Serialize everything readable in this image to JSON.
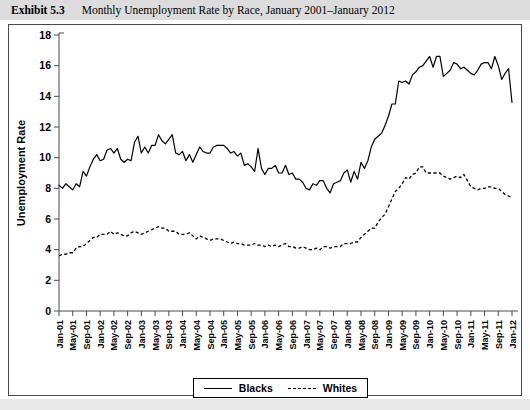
{
  "caption": {
    "number": "Exhibit 5.3",
    "title": "Monthly Unemployment Rate by Race, January 2001–January 2012"
  },
  "legend": {
    "items": [
      {
        "label": "Blacks",
        "style": "solid"
      },
      {
        "label": "Whites",
        "style": "dashed"
      }
    ]
  },
  "chart_data": {
    "type": "line",
    "title": "Monthly Unemployment Rate by Race, January 2001–January 2012",
    "xlabel": "",
    "ylabel": "Unemployment Rate",
    "ylim": [
      0,
      18
    ],
    "yticks": [
      0,
      2,
      4,
      6,
      8,
      10,
      12,
      14,
      16,
      18
    ],
    "grid": false,
    "legend_position": "bottom",
    "x_tick_labels": [
      "Jan-01",
      "May-01",
      "Sep-01",
      "Jan-02",
      "May-02",
      "Sep-02",
      "Jan-03",
      "May-03",
      "Sep-03",
      "Jan-04",
      "May-04",
      "Sep-04",
      "Jan-05",
      "May-05",
      "Sep-05",
      "Jan-06",
      "May-06",
      "Sep-06",
      "Jan-07",
      "May-07",
      "Sep-07",
      "Jan-08",
      "May-08",
      "Sep-08",
      "Jan-09",
      "May-09",
      "Sep-09",
      "Jan-10",
      "May-10",
      "Sep-10",
      "Jan-11",
      "May-11",
      "Sep-11",
      "Jan-12"
    ],
    "x_tick_every_n_points": 4,
    "x": [
      "Jan-01",
      "Feb-01",
      "Mar-01",
      "Apr-01",
      "May-01",
      "Jun-01",
      "Jul-01",
      "Aug-01",
      "Sep-01",
      "Oct-01",
      "Nov-01",
      "Dec-01",
      "Jan-02",
      "Feb-02",
      "Mar-02",
      "Apr-02",
      "May-02",
      "Jun-02",
      "Jul-02",
      "Aug-02",
      "Sep-02",
      "Oct-02",
      "Nov-02",
      "Dec-02",
      "Jan-03",
      "Feb-03",
      "Mar-03",
      "Apr-03",
      "May-03",
      "Jun-03",
      "Jul-03",
      "Aug-03",
      "Sep-03",
      "Oct-03",
      "Nov-03",
      "Dec-03",
      "Jan-04",
      "Feb-04",
      "Mar-04",
      "Apr-04",
      "May-04",
      "Jun-04",
      "Jul-04",
      "Aug-04",
      "Sep-04",
      "Oct-04",
      "Nov-04",
      "Dec-04",
      "Jan-05",
      "Feb-05",
      "Mar-05",
      "Apr-05",
      "May-05",
      "Jun-05",
      "Jul-05",
      "Aug-05",
      "Sep-05",
      "Oct-05",
      "Nov-05",
      "Dec-05",
      "Jan-06",
      "Feb-06",
      "Mar-06",
      "Apr-06",
      "May-06",
      "Jun-06",
      "Jul-06",
      "Aug-06",
      "Sep-06",
      "Oct-06",
      "Nov-06",
      "Dec-06",
      "Jan-07",
      "Feb-07",
      "Mar-07",
      "Apr-07",
      "May-07",
      "Jun-07",
      "Jul-07",
      "Aug-07",
      "Sep-07",
      "Oct-07",
      "Nov-07",
      "Dec-07",
      "Jan-08",
      "Feb-08",
      "Mar-08",
      "Apr-08",
      "May-08",
      "Jun-08",
      "Jul-08",
      "Aug-08",
      "Sep-08",
      "Oct-08",
      "Nov-08",
      "Dec-08",
      "Jan-09",
      "Feb-09",
      "Mar-09",
      "Apr-09",
      "May-09",
      "Jun-09",
      "Jul-09",
      "Aug-09",
      "Sep-09",
      "Oct-09",
      "Nov-09",
      "Dec-09",
      "Jan-10",
      "Feb-10",
      "Mar-10",
      "Apr-10",
      "May-10",
      "Jun-10",
      "Jul-10",
      "Aug-10",
      "Sep-10",
      "Oct-10",
      "Nov-10",
      "Dec-10",
      "Jan-11",
      "Feb-11",
      "Mar-11",
      "Apr-11",
      "May-11",
      "Jun-11",
      "Jul-11",
      "Aug-11",
      "Sep-11",
      "Oct-11",
      "Nov-11",
      "Dec-11",
      "Jan-12"
    ],
    "series": [
      {
        "name": "Blacks",
        "style": "solid",
        "values": [
          8.2,
          8.0,
          8.3,
          8.1,
          7.9,
          8.3,
          8.1,
          9.1,
          8.8,
          9.4,
          9.9,
          10.2,
          9.8,
          9.9,
          10.5,
          10.6,
          10.3,
          10.6,
          9.9,
          9.7,
          9.9,
          9.8,
          11.0,
          11.4,
          10.3,
          10.7,
          10.3,
          10.8,
          10.8,
          11.5,
          11.1,
          10.9,
          11.2,
          11.5,
          10.3,
          10.2,
          10.4,
          9.8,
          10.2,
          9.7,
          10.2,
          10.7,
          10.4,
          10.3,
          10.3,
          10.7,
          10.8,
          10.8,
          10.8,
          10.6,
          10.3,
          10.4,
          10.1,
          10.3,
          9.5,
          9.6,
          9.4,
          9.1,
          10.6,
          9.3,
          8.9,
          9.3,
          9.3,
          9.5,
          9.0,
          9.0,
          9.5,
          8.9,
          9.0,
          8.6,
          8.6,
          8.4,
          8.0,
          7.9,
          8.3,
          8.2,
          8.5,
          8.5,
          8.0,
          7.7,
          8.3,
          8.4,
          8.5,
          9.0,
          9.2,
          8.4,
          9.1,
          8.6,
          9.7,
          9.3,
          9.8,
          10.7,
          11.2,
          11.4,
          11.6,
          12.1,
          12.7,
          13.5,
          13.5,
          15.0,
          14.9,
          15.0,
          14.8,
          15.4,
          15.6,
          15.9,
          16.0,
          16.3,
          16.6,
          15.9,
          16.6,
          16.6,
          15.3,
          15.5,
          15.7,
          16.2,
          16.1,
          15.8,
          15.9,
          15.7,
          15.5,
          15.4,
          15.7,
          16.1,
          16.2,
          16.2,
          15.8,
          16.6,
          16.0,
          15.1,
          15.5,
          15.8,
          13.6
        ]
      },
      {
        "name": "Whites",
        "style": "dashed",
        "values": [
          3.6,
          3.7,
          3.7,
          3.8,
          3.8,
          4.1,
          4.2,
          4.2,
          4.4,
          4.6,
          4.8,
          4.8,
          5.0,
          5.0,
          5.0,
          5.2,
          5.0,
          5.1,
          5.0,
          4.9,
          4.9,
          5.1,
          5.2,
          5.1,
          5.0,
          5.1,
          5.2,
          5.3,
          5.4,
          5.5,
          5.4,
          5.4,
          5.2,
          5.2,
          5.2,
          5.0,
          5.0,
          5.0,
          5.1,
          4.9,
          4.7,
          4.9,
          4.8,
          4.7,
          4.6,
          4.7,
          4.7,
          4.7,
          4.6,
          4.5,
          4.4,
          4.5,
          4.4,
          4.4,
          4.3,
          4.3,
          4.3,
          4.4,
          4.3,
          4.3,
          4.2,
          4.3,
          4.2,
          4.3,
          4.2,
          4.3,
          4.4,
          4.2,
          4.2,
          4.1,
          4.1,
          4.2,
          4.1,
          4.0,
          4.0,
          4.1,
          4.0,
          4.2,
          4.2,
          4.1,
          4.2,
          4.2,
          4.2,
          4.4,
          4.4,
          4.4,
          4.5,
          4.5,
          4.8,
          5.0,
          5.2,
          5.4,
          5.4,
          5.8,
          6.1,
          6.3,
          6.8,
          7.3,
          7.8,
          8.0,
          8.3,
          8.7,
          8.6,
          8.9,
          9.0,
          9.4,
          9.4,
          9.0,
          9.0,
          9.0,
          9.0,
          9.0,
          8.8,
          8.7,
          8.6,
          8.7,
          8.8,
          8.7,
          8.9,
          8.5,
          8.1,
          8.0,
          7.9,
          8.0,
          8.0,
          8.1,
          8.1,
          8.0,
          8.0,
          7.8,
          7.6,
          7.5,
          7.4
        ]
      }
    ]
  }
}
